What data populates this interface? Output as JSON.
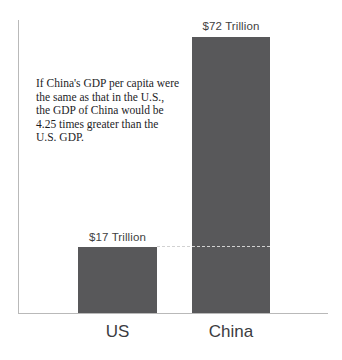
{
  "chart_data": {
    "type": "bar",
    "title": "",
    "subtitle": "",
    "xlabel": "",
    "ylabel": "",
    "categories": [
      "US",
      "China"
    ],
    "values": [
      17,
      72
    ],
    "value_labels": [
      "$17 Trillion",
      "$72 Trillion"
    ],
    "unit": "Trillion USD",
    "ylim": [
      0,
      76
    ],
    "grid": false,
    "legend": null,
    "bar_color": "#58585a",
    "axis_color": "#b9b9b9",
    "annotations": [
      {
        "name": "comparison-note",
        "lines": [
          "If China's GDP per capita were",
          "the same as that in the U.S.,",
          "the GDP of China would be",
          "4.25 times greater than the",
          "U.S. GDP."
        ]
      },
      {
        "name": "leader-line",
        "style": "dashed",
        "color": "#d2d2d2",
        "from_value": 17,
        "description": "dashed line at US bar height extended across China bar"
      }
    ]
  }
}
